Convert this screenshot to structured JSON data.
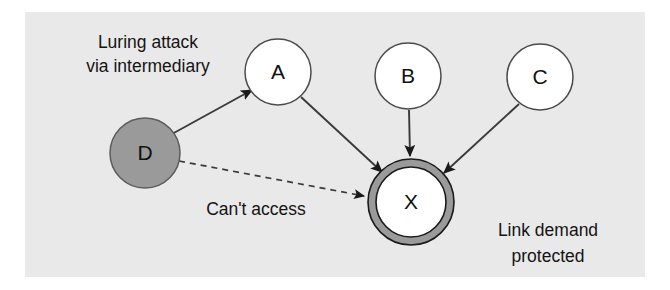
{
  "figure": {
    "panel_bg": "#e9e9e9",
    "page_bg": "#ffffff"
  },
  "nodes": [
    {
      "id": "A",
      "label": "A",
      "role": "intermediary",
      "fill": "#ffffff",
      "stroke": "#4a4a4a",
      "cx": 278,
      "cy": 72,
      "r": 33
    },
    {
      "id": "B",
      "label": "B",
      "role": "caller",
      "fill": "#ffffff",
      "stroke": "#4a4a4a",
      "cx": 408,
      "cy": 76,
      "r": 33
    },
    {
      "id": "C",
      "label": "C",
      "role": "caller",
      "fill": "#ffffff",
      "stroke": "#4a4a4a",
      "cx": 540,
      "cy": 77,
      "r": 33
    },
    {
      "id": "D",
      "label": "D",
      "role": "attacker",
      "fill": "#9a9a9a",
      "stroke": "#5c5c5c",
      "cx": 145,
      "cy": 153,
      "r": 35
    },
    {
      "id": "X",
      "label": "X",
      "role": "protected-target",
      "fill": "#ffffff",
      "stroke": "#1a1a1a",
      "ring_fill": "#9a9a9a",
      "cx": 411,
      "cy": 202,
      "r": 36,
      "ring_r": 43
    }
  ],
  "edges": [
    {
      "id": "d-to-a",
      "from": "D",
      "to": "A",
      "style": "solid",
      "arrow": true
    },
    {
      "id": "a-to-x",
      "from": "A",
      "to": "X",
      "style": "solid",
      "arrow": true
    },
    {
      "id": "b-to-x",
      "from": "B",
      "to": "X",
      "style": "solid",
      "arrow": true
    },
    {
      "id": "c-to-x",
      "from": "C",
      "to": "X",
      "style": "solid",
      "arrow": true
    },
    {
      "id": "d-to-x",
      "from": "D",
      "to": "X",
      "style": "dashed",
      "arrow": true
    }
  ],
  "annotations": {
    "luring": {
      "line1": "Luring attack",
      "line2": "via intermediary",
      "x": 148,
      "y1": 48,
      "y2": 72
    },
    "cant_access": {
      "text": "Can't access",
      "x": 256,
      "y": 215
    },
    "link_demand": {
      "line1": "Link demand",
      "line2": "protected",
      "x": 548,
      "y1": 236,
      "y2": 262
    }
  },
  "colors": {
    "stroke_dark": "#2a2a2a",
    "node_stroke": "#4a4a4a",
    "attacker_fill": "#9a9a9a",
    "ring_fill": "#9a9a9a",
    "text": "#141414",
    "panel": "#e9e9e9"
  }
}
